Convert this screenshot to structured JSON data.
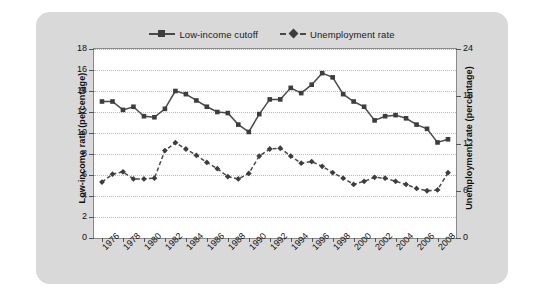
{
  "legend": {
    "position": "top-center",
    "entries": [
      {
        "label": "Low-income cutoff",
        "marker": "square",
        "line": "solid",
        "color": "#3d3d3d"
      },
      {
        "label": "Unemployment rate",
        "marker": "diamond",
        "line": "dashed",
        "color": "#3d3d3d"
      }
    ]
  },
  "chart_data": {
    "type": "line",
    "title": "",
    "xlabel": "",
    "ylabel": "Low-income rate (percentage)",
    "y2label": "Unemployment rate (percentage)",
    "grid": true,
    "ylim": [
      0,
      18
    ],
    "y2lim": [
      0,
      24
    ],
    "yticks": [
      0,
      2,
      4,
      6,
      8,
      10,
      12,
      14,
      16,
      18
    ],
    "y2ticks": [
      0,
      6,
      12,
      18,
      24
    ],
    "xticks": [
      1976,
      1978,
      1980,
      1982,
      1984,
      1986,
      1988,
      1990,
      1992,
      1994,
      1996,
      1998,
      2000,
      2002,
      2004,
      2006,
      2008
    ],
    "x": [
      1976,
      1977,
      1978,
      1979,
      1980,
      1981,
      1982,
      1983,
      1984,
      1985,
      1986,
      1987,
      1988,
      1989,
      1990,
      1991,
      1992,
      1993,
      1994,
      1995,
      1996,
      1997,
      1998,
      1999,
      2000,
      2001,
      2002,
      2003,
      2004,
      2005,
      2006,
      2007,
      2008,
      2009
    ],
    "series": [
      {
        "name": "Low-income cutoff",
        "axis": "left",
        "marker": "square",
        "line": "solid",
        "values": [
          13.0,
          13.0,
          12.2,
          12.5,
          11.6,
          11.5,
          12.3,
          14.0,
          13.7,
          13.1,
          12.5,
          12.0,
          11.9,
          10.8,
          10.1,
          11.8,
          13.2,
          13.2,
          14.3,
          13.8,
          14.6,
          15.7,
          15.3,
          13.7,
          13.0,
          12.5,
          11.2,
          11.6,
          11.7,
          11.4,
          10.8,
          10.4,
          9.1,
          9.4
        ]
      },
      {
        "name": "Unemployment rate",
        "axis": "right",
        "marker": "diamond",
        "line": "dashed",
        "values": [
          7.1,
          8.1,
          8.4,
          7.5,
          7.5,
          7.6,
          11.1,
          12.1,
          11.3,
          10.5,
          9.6,
          8.8,
          7.8,
          7.5,
          8.2,
          10.4,
          11.3,
          11.4,
          10.4,
          9.5,
          9.7,
          9.1,
          8.3,
          7.6,
          6.8,
          7.2,
          7.7,
          7.6,
          7.2,
          6.8,
          6.3,
          6.0,
          6.1,
          8.3
        ]
      }
    ],
    "series_right_axis_plotted": {
      "note": "Unemployment rate values read against right axis (0-24)"
    }
  }
}
